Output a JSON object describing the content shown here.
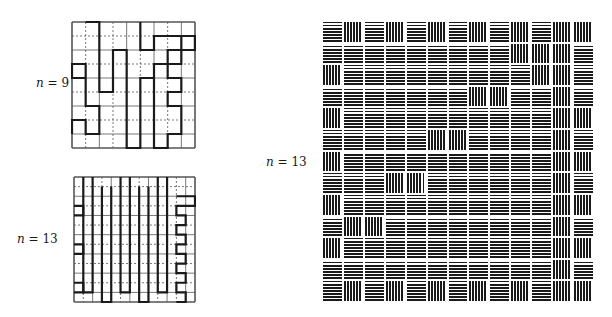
{
  "labels": {
    "fig_a": {
      "var": "n",
      "rest": " = 9"
    },
    "fig_b": {
      "var": "n",
      "rest": " = 13"
    },
    "fig_c": {
      "var": "n",
      "rest": " = 13"
    }
  },
  "figures": {
    "fig_a": {
      "n": 9,
      "grid_size": 9,
      "path": [
        [
          1,
          0
        ],
        [
          2,
          0
        ],
        [
          2,
          5
        ],
        [
          3,
          5
        ],
        [
          3,
          2
        ],
        [
          4,
          2
        ],
        [
          4,
          9
        ],
        [
          5,
          9
        ],
        [
          5,
          4
        ],
        [
          6,
          4
        ],
        [
          6,
          9
        ],
        [
          7,
          9
        ],
        [
          7,
          8
        ],
        [
          8,
          8
        ],
        [
          8,
          6
        ],
        [
          7,
          6
        ],
        [
          7,
          5
        ],
        [
          8,
          5
        ],
        [
          8,
          4
        ],
        [
          7,
          4
        ],
        [
          7,
          3
        ],
        [
          8,
          3
        ],
        [
          8,
          1
        ],
        [
          9,
          1
        ],
        [
          9,
          2
        ],
        [
          7,
          2
        ],
        [
          7,
          3
        ],
        [
          6,
          3
        ],
        [
          6,
          9
        ]
      ],
      "path_b": [
        [
          0,
          8
        ],
        [
          0,
          7
        ],
        [
          1,
          7
        ],
        [
          1,
          8
        ],
        [
          2,
          8
        ],
        [
          2,
          6
        ],
        [
          1,
          6
        ],
        [
          1,
          3
        ],
        [
          0,
          3
        ],
        [
          0,
          4
        ],
        [
          1,
          4
        ]
      ],
      "path_c": [
        [
          5,
          0
        ],
        [
          5,
          2
        ],
        [
          6,
          2
        ],
        [
          6,
          1
        ],
        [
          9,
          1
        ],
        [
          9,
          2
        ]
      ]
    },
    "fig_b": {
      "n": 13,
      "grid_size": 13
    },
    "fig_c": {
      "n": 13,
      "blocks": [
        "HVHVHVHVHVHVV",
        "HHHHHHHHHVVVH",
        "VHHHHHHHHHVVH",
        "HHHHHHHVVHHVH",
        "VHHHHHHHHHHVV",
        "HHHHHVVHHHHVH",
        "VHHHHHHHHHHVV",
        "HHHVVHHHHHHVH",
        "VHHHHHHHHHHVV",
        "HVVHHHHHHHHVH",
        "VHHHHHHHHHHVV",
        "HHHHHHHHHHHVH",
        "HVHVHVHVHVHVV"
      ]
    }
  },
  "colors": {
    "ink": "#1a1a1a",
    "paper": "#ffffff",
    "gridline": "#555555"
  }
}
